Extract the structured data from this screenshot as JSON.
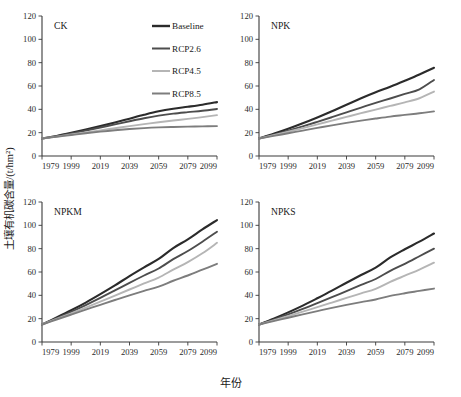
{
  "chart_data": {
    "type": "line",
    "title": "",
    "xlabel": "年份",
    "ylabel": "土壤有机碳含量/(t/hm²)",
    "xlim": [
      1979,
      2099
    ],
    "ylim": [
      0,
      120
    ],
    "xticks": [
      1979,
      1999,
      2019,
      2039,
      2059,
      2079,
      2099
    ],
    "yticks": [
      0,
      20,
      40,
      60,
      80,
      100,
      120
    ],
    "grid": false,
    "legend_position": "top-right of first panel",
    "legend": [
      "Baseline",
      "RCP2.6",
      "RCP4.5",
      "RCP8.5"
    ],
    "series_colors": [
      "#2b2b2b",
      "#4d4d4d",
      "#b5b5b5",
      "#7d7d7d"
    ],
    "x": [
      1979,
      1989,
      1999,
      2009,
      2019,
      2029,
      2039,
      2049,
      2059,
      2069,
      2079,
      2089,
      2099
    ],
    "panels": [
      {
        "label": "CK",
        "series": [
          {
            "name": "Baseline",
            "values": [
              15.0,
              17.2,
              19.8,
              22.6,
              25.6,
              28.7,
              32.0,
              35.3,
              38.3,
              40.5,
              42.2,
              44.0,
              46.2
            ]
          },
          {
            "name": "RCP2.6",
            "values": [
              15.0,
              17.0,
              19.3,
              21.8,
              24.4,
              27.1,
              29.8,
              32.4,
              34.6,
              36.3,
              37.6,
              38.8,
              40.3
            ]
          },
          {
            "name": "RCP4.5",
            "values": [
              15.0,
              16.6,
              18.4,
              20.2,
              22.0,
              23.8,
              25.6,
              27.3,
              28.9,
              30.4,
              31.8,
              33.3,
              35.0
            ]
          },
          {
            "name": "RCP8.5",
            "values": [
              15.0,
              16.5,
              18.0,
              19.5,
              20.9,
              22.1,
              23.1,
              23.9,
              24.5,
              24.9,
              25.2,
              25.4,
              25.6
            ]
          }
        ]
      },
      {
        "label": "NPK",
        "series": [
          {
            "name": "Baseline",
            "values": [
              15.0,
              19.0,
              23.3,
              28.0,
              33.0,
              38.3,
              44.0,
              49.5,
              54.6,
              59.4,
              64.5,
              69.8,
              75.6
            ]
          },
          {
            "name": "RCP2.6",
            "values": [
              15.0,
              18.2,
              21.7,
              25.4,
              29.3,
              33.3,
              37.4,
              41.5,
              45.5,
              49.3,
              53.2,
              57.2,
              65.2
            ]
          },
          {
            "name": "RCP4.5",
            "values": [
              15.0,
              17.8,
              20.8,
              23.9,
              27.1,
              30.3,
              33.5,
              36.7,
              39.8,
              42.9,
              46.0,
              49.5,
              55.2
            ]
          },
          {
            "name": "RCP8.5",
            "values": [
              15.0,
              17.2,
              19.5,
              21.8,
              24.1,
              26.3,
              28.4,
              30.3,
              32.1,
              33.8,
              35.2,
              36.6,
              38.2
            ]
          }
        ]
      },
      {
        "label": "NPKM",
        "series": [
          {
            "name": "Baseline",
            "values": [
              15.0,
              21.0,
              27.2,
              33.8,
              41.0,
              48.5,
              56.5,
              64.0,
              71.2,
              80.5,
              88.0,
              96.5,
              104.5
            ]
          },
          {
            "name": "RCP2.6",
            "values": [
              15.0,
              20.4,
              25.9,
              31.7,
              37.8,
              44.2,
              50.7,
              57.0,
              63.0,
              71.0,
              78.0,
              86.0,
              94.5
            ]
          },
          {
            "name": "RCP4.5",
            "values": [
              15.0,
              19.8,
              24.6,
              29.5,
              34.6,
              39.8,
              45.0,
              50.2,
              55.2,
              62.0,
              68.5,
              76.0,
              85.0
            ]
          },
          {
            "name": "RCP8.5",
            "values": [
              15.0,
              19.3,
              23.5,
              27.7,
              31.9,
              36.0,
              40.0,
              43.8,
              47.5,
              52.5,
              57.0,
              62.0,
              67.0
            ]
          }
        ]
      },
      {
        "label": "NPKS",
        "series": [
          {
            "name": "Baseline",
            "values": [
              15.0,
              20.0,
              25.4,
              31.2,
              37.5,
              44.0,
              50.8,
              57.4,
              63.8,
              72.5,
              79.5,
              86.0,
              93.0
            ]
          },
          {
            "name": "RCP2.6",
            "values": [
              15.0,
              19.2,
              23.6,
              28.3,
              33.3,
              38.4,
              43.7,
              48.9,
              54.0,
              61.0,
              67.0,
              73.5,
              80.0
            ]
          },
          {
            "name": "RCP4.5",
            "values": [
              15.0,
              18.5,
              22.2,
              26.0,
              29.9,
              33.8,
              37.8,
              41.7,
              45.6,
              51.5,
              56.8,
              62.0,
              68.0
            ]
          },
          {
            "name": "RCP8.5",
            "values": [
              15.0,
              17.9,
              20.8,
              23.7,
              26.5,
              29.2,
              31.8,
              34.2,
              36.4,
              39.5,
              41.8,
              43.8,
              45.8
            ]
          }
        ]
      }
    ]
  }
}
